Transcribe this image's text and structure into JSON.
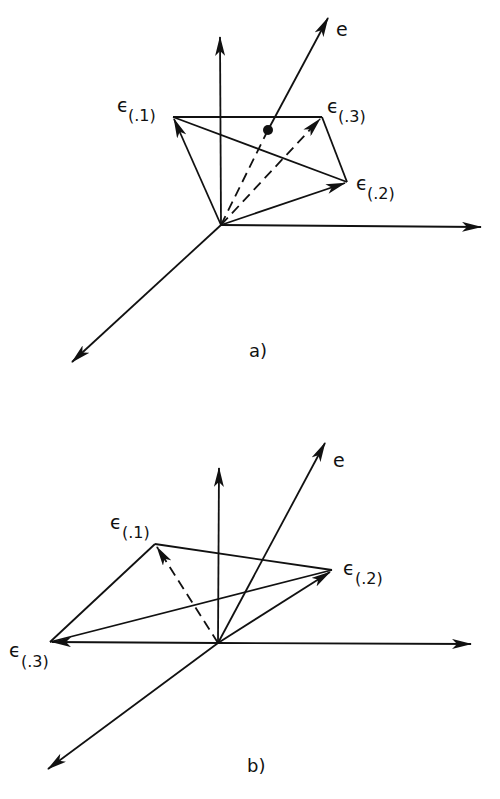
{
  "figure": {
    "panels": [
      {
        "id": "a",
        "caption": "a)",
        "vector_e_label": "e",
        "vectors": [
          {
            "name": "eps1",
            "symbol": "ϵ",
            "subscript": "(.1)",
            "style": "solid"
          },
          {
            "name": "eps2",
            "symbol": "ϵ",
            "subscript": "(.2)",
            "style": "solid"
          },
          {
            "name": "eps3",
            "symbol": "ϵ",
            "subscript": "(.3)",
            "style": "dashed"
          }
        ],
        "e_intersection_point": "dot on triangle plane"
      },
      {
        "id": "b",
        "caption": "b)",
        "vector_e_label": "e",
        "vectors": [
          {
            "name": "eps1",
            "symbol": "ϵ",
            "subscript": "(.1)",
            "style": "dashed"
          },
          {
            "name": "eps2",
            "symbol": "ϵ",
            "subscript": "(.2)",
            "style": "solid"
          },
          {
            "name": "eps3",
            "symbol": "ϵ",
            "subscript": "(.3)",
            "style": "solid"
          }
        ]
      }
    ]
  },
  "colors": {
    "ink": "#111111",
    "background": "#ffffff"
  }
}
